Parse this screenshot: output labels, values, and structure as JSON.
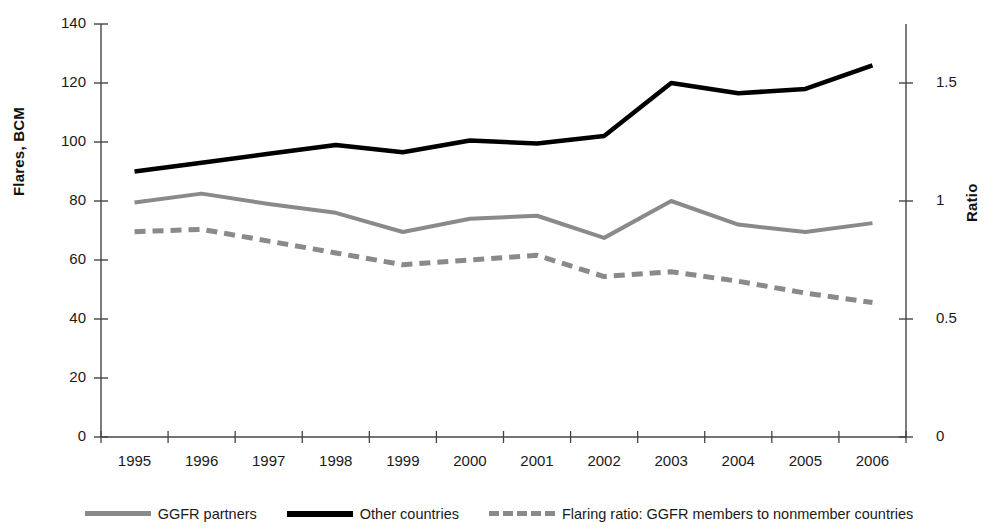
{
  "chart_data": {
    "type": "line",
    "title": "",
    "xlabel": "",
    "ylabel": "Flares, BCM",
    "y2label": "Ratio",
    "categories": [
      "1995",
      "1996",
      "1997",
      "1998",
      "1999",
      "2000",
      "2001",
      "2002",
      "2003",
      "2004",
      "2005",
      "2006"
    ],
    "ylim": [
      0,
      140
    ],
    "yticks": [
      0,
      20,
      40,
      60,
      80,
      100,
      120,
      140
    ],
    "y2lim": [
      0,
      1.75
    ],
    "y2ticks": [
      0,
      0.5,
      1,
      1.5
    ],
    "grid": false,
    "legend_position": "bottom",
    "series": [
      {
        "name": "GGFR partners",
        "axis": "left",
        "style": "solid",
        "color": "#8a8a8a",
        "values": [
          79.5,
          82.5,
          79.0,
          76.0,
          69.5,
          74.0,
          75.0,
          67.5,
          80.0,
          72.0,
          69.5,
          72.5
        ]
      },
      {
        "name": "Other countries",
        "axis": "left",
        "style": "solid",
        "color": "#000000",
        "values": [
          90.0,
          93.0,
          96.0,
          99.0,
          96.5,
          100.5,
          99.5,
          102.0,
          120.0,
          116.5,
          118.0,
          126.0
        ]
      },
      {
        "name": "Flaring ratio: GGFR members to nonmember countries",
        "axis": "right",
        "style": "dashed",
        "color": "#8a8a8a",
        "values": [
          0.87,
          0.88,
          0.83,
          0.78,
          0.73,
          0.75,
          0.77,
          0.68,
          0.7,
          0.66,
          0.61,
          0.57
        ]
      }
    ]
  },
  "axes": {
    "left_title": "Flares, BCM",
    "right_title": "Ratio",
    "left_ticks": [
      "140",
      "120",
      "100",
      "80",
      "60",
      "40",
      "20",
      "0"
    ],
    "right_ticks": [
      "1.5",
      "1",
      "0.5",
      "0"
    ],
    "x_ticks": [
      "1995",
      "1996",
      "1997",
      "1998",
      "1999",
      "2000",
      "2001",
      "2002",
      "2003",
      "2004",
      "2005",
      "2006"
    ]
  },
  "legend": {
    "items": [
      {
        "label": "GGFR partners",
        "swatch": "gray"
      },
      {
        "label": "Other countries",
        "swatch": "black"
      },
      {
        "label": "Flaring ratio: GGFR members to nonmember countries",
        "swatch": "dashed"
      }
    ]
  }
}
